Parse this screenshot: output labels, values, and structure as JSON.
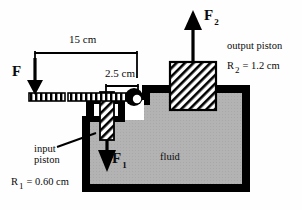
{
  "diagram": {
    "colors": {
      "outline": "#000000",
      "fluid": "#b3b3b3",
      "wall": "#000000",
      "background": "#ffffff",
      "hatch": "#000000"
    },
    "dimensions": {
      "lever_long_arm": "15 cm",
      "lever_short_arm": "2.5 cm"
    },
    "forces": {
      "applied": {
        "symbol": "F",
        "subscript": ""
      },
      "input": {
        "symbol": "F",
        "subscript": "1"
      },
      "output": {
        "symbol": "F",
        "subscript": "2"
      }
    },
    "labels": {
      "output_piston": "output piston",
      "output_radius_symbol": "R",
      "output_radius_subscript": "2",
      "output_radius_value": "= 1.2 cm",
      "input_piston_line1": "input",
      "input_piston_line2": "piston",
      "input_radius_symbol": "R",
      "input_radius_subscript": "1",
      "input_radius_value": "= 0.60 cm",
      "fluid": "fluid"
    }
  }
}
